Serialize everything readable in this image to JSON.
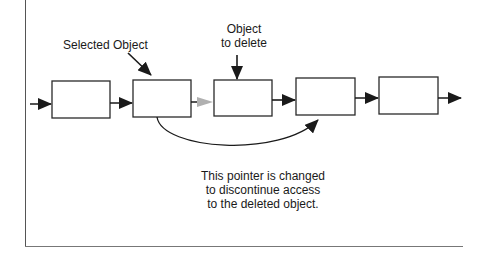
{
  "diagram": {
    "type": "linked-list-deletion",
    "labels": {
      "selected_object": "Selected Object",
      "object_to_delete_line1": "Object",
      "object_to_delete_line2": "to delete",
      "caption_line1": "This pointer is changed",
      "caption_line2": "to discontinue access",
      "caption_line3": "to the deleted  object."
    },
    "nodes": [
      {
        "id": "node-1",
        "role": "head"
      },
      {
        "id": "node-2",
        "role": "selected"
      },
      {
        "id": "node-3",
        "role": "to-delete"
      },
      {
        "id": "node-4",
        "role": "next"
      },
      {
        "id": "node-5",
        "role": "tail"
      }
    ],
    "colors": {
      "stroke": "#2a2a2a",
      "faded_pointer": "#b0b0b0",
      "background": "#ffffff"
    }
  }
}
